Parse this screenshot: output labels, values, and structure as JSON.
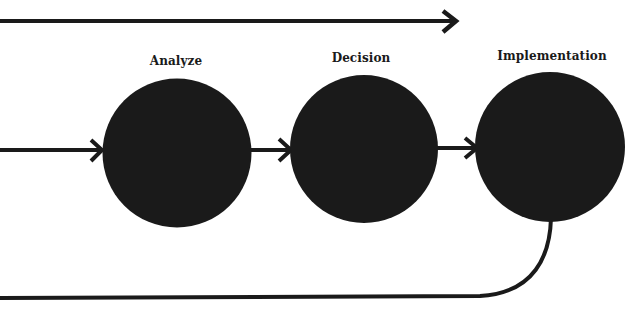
{
  "diagram": {
    "type": "process-flow",
    "colors": {
      "background": "#ffffff",
      "ink": "#1a1a1a"
    },
    "stages": [
      {
        "id": "analyze",
        "label": "Analyze"
      },
      {
        "id": "decision",
        "label": "Decision"
      },
      {
        "id": "implementation",
        "label": "Implementation"
      }
    ],
    "connectors": [
      {
        "from": "left-edge",
        "to": "analyze",
        "kind": "arrow"
      },
      {
        "from": "analyze",
        "to": "decision",
        "kind": "arrow"
      },
      {
        "from": "decision",
        "to": "implementation",
        "kind": "arrow"
      },
      {
        "from": "implementation",
        "to": "left-edge",
        "kind": "curved-feedback-line"
      },
      {
        "from": "left-edge",
        "to": "right",
        "kind": "overall-direction-arrow"
      }
    ]
  }
}
